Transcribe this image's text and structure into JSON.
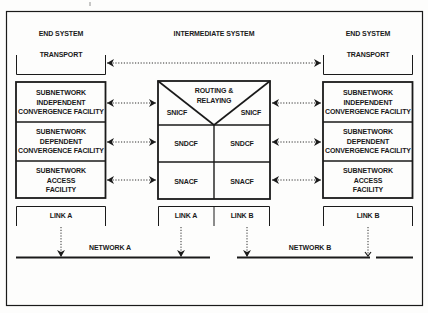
{
  "diagram": {
    "type": "protocol-architecture",
    "colors": {
      "line": "#1a1a1a",
      "background": "#fdfdfc"
    },
    "columns": {
      "left": {
        "title": "END SYSTEM",
        "transport": "TRANSPORT",
        "layers": [
          "SUBNETWORK\nINDEPENDENT\nCONVERGENCE FACILITY",
          "SUBNETWORK\nDEPENDENT\nCONVERGENCE FACILITY",
          "SUBNETWORK\nACCESS\nFACILITY"
        ],
        "link": "LINK A"
      },
      "middle": {
        "title": "INTERMEDIATE SYSTEM",
        "routing": "ROUTING &\nRELAYING",
        "snicf_left": "SNICF",
        "snicf_right": "SNICF",
        "sndcf_left": "SNDCF",
        "sndcf_right": "SNDCF",
        "snacf_left": "SNACF",
        "snacf_right": "SNACF",
        "link_left": "LINK A",
        "link_right": "LINK B"
      },
      "right": {
        "title": "END SYSTEM",
        "transport": "TRANSPORT",
        "layers": [
          "SUBNETWORK\nINDEPENDENT\nCONVERGENCE FACILITY",
          "SUBNETWORK\nDEPENDENT\nCONVERGENCE FACILITY",
          "SUBNETWORK\nACCESS\nFACILITY"
        ],
        "link": "LINK B"
      }
    },
    "networks": {
      "a": "NETWORK A",
      "b": "NETWORK B"
    }
  }
}
